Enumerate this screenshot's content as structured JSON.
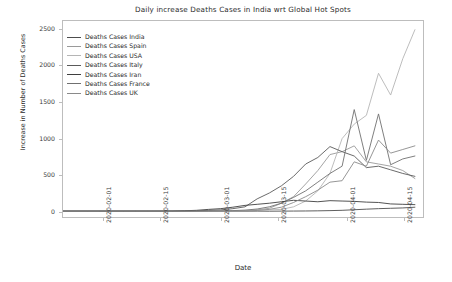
{
  "chart_data": {
    "type": "line",
    "title": "Daily increase Deaths Cases in India wrt Global Hot Spots",
    "xlabel": "Date",
    "ylabel": "Increase in Number of Deaths Cases",
    "grid": false,
    "legend_position": "upper left",
    "ylim": [
      -80,
      2620
    ],
    "yticks": [
      0,
      500,
      1000,
      1500,
      2000,
      2500
    ],
    "ytick_labels": [
      "0",
      "500",
      "1000",
      "1500",
      "2000",
      "2500"
    ],
    "xlim": [
      "2020-01-22",
      "2020-04-20"
    ],
    "xticks": [
      "2020-02-01",
      "2020-02-15",
      "2020-03-01",
      "2020-03-15",
      "2020-04-01",
      "2020-04-15"
    ],
    "xtick_labels": [
      "2020-02-01",
      "2020-02-15",
      "2020-03-01",
      "2020-03-15",
      "2020-04-01",
      "2020-04-15"
    ],
    "x": [
      "2020-01-22",
      "2020-01-25",
      "2020-01-28",
      "2020-01-31",
      "2020-02-03",
      "2020-02-06",
      "2020-02-09",
      "2020-02-12",
      "2020-02-15",
      "2020-02-18",
      "2020-02-21",
      "2020-02-24",
      "2020-02-27",
      "2020-03-01",
      "2020-03-04",
      "2020-03-07",
      "2020-03-10",
      "2020-03-13",
      "2020-03-16",
      "2020-03-19",
      "2020-03-22",
      "2020-03-25",
      "2020-03-28",
      "2020-03-31",
      "2020-04-03",
      "2020-04-06",
      "2020-04-09",
      "2020-04-12",
      "2020-04-15",
      "2020-04-18"
    ],
    "series": [
      {
        "name": "Deaths Cases India",
        "color": "#4d4d4d",
        "values": [
          0,
          0,
          0,
          0,
          0,
          0,
          0,
          0,
          0,
          0,
          0,
          0,
          0,
          0,
          0,
          0,
          1,
          0,
          1,
          2,
          3,
          5,
          8,
          12,
          20,
          28,
          35,
          40,
          45,
          55
        ]
      },
      {
        "name": "Deaths Cases Spain",
        "color": "#9a9a9a",
        "values": [
          0,
          0,
          0,
          0,
          0,
          0,
          0,
          0,
          0,
          0,
          0,
          0,
          1,
          0,
          2,
          5,
          18,
          40,
          110,
          200,
          375,
          560,
          780,
          820,
          900,
          680,
          650,
          620,
          560,
          450
        ]
      },
      {
        "name": "Deaths Cases USA",
        "color": "#b5b5b5",
        "values": [
          0,
          0,
          0,
          0,
          0,
          0,
          0,
          0,
          0,
          0,
          0,
          0,
          0,
          1,
          3,
          6,
          10,
          18,
          25,
          60,
          140,
          280,
          520,
          1000,
          1200,
          1320,
          1900,
          1600,
          2100,
          2500
        ]
      },
      {
        "name": "Deaths Cases Italy",
        "color": "#5a5a5a",
        "values": [
          0,
          0,
          0,
          0,
          0,
          0,
          0,
          0,
          0,
          0,
          2,
          5,
          12,
          18,
          35,
          60,
          170,
          250,
          350,
          480,
          650,
          740,
          890,
          820,
          760,
          600,
          620,
          570,
          520,
          480
        ]
      },
      {
        "name": "Deaths Cases Iran",
        "color": "#3f3f3f",
        "values": [
          0,
          0,
          0,
          0,
          0,
          0,
          0,
          0,
          0,
          2,
          6,
          12,
          25,
          35,
          55,
          80,
          95,
          110,
          130,
          150,
          140,
          130,
          145,
          140,
          135,
          125,
          120,
          100,
          95,
          90
        ]
      },
      {
        "name": "Deaths Cases France",
        "color": "#707070",
        "values": [
          0,
          0,
          0,
          0,
          0,
          0,
          0,
          0,
          1,
          0,
          0,
          1,
          2,
          3,
          8,
          15,
          30,
          60,
          110,
          190,
          280,
          400,
          520,
          620,
          1400,
          700,
          1340,
          640,
          720,
          760
        ]
      },
      {
        "name": "Deaths Cases UK",
        "color": "#8a8a8a",
        "values": [
          0,
          0,
          0,
          0,
          0,
          0,
          0,
          0,
          0,
          0,
          0,
          0,
          0,
          1,
          2,
          4,
          10,
          25,
          55,
          120,
          200,
          290,
          400,
          420,
          680,
          620,
          980,
          800,
          850,
          900
        ]
      }
    ]
  }
}
